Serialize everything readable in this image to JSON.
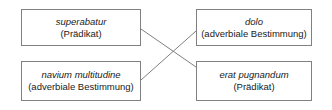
{
  "diagram": {
    "type": "crossed-correspondence-diagram",
    "background_color": "#ffffff",
    "border_color": "#808080",
    "connector_color": "#808080",
    "text_color": "#1a1a1a",
    "nodes": [
      {
        "id": "superabatur",
        "term": "superabatur",
        "role": "(Prädikat)"
      },
      {
        "id": "dolo",
        "term": "dolo",
        "role": "(adverbiale Bestimmung)"
      },
      {
        "id": "navium-multitudine",
        "term": "navium multitudine",
        "role": "(adverbiale Bestimmung)"
      },
      {
        "id": "erat-pugnandum",
        "term": "erat pugnandum",
        "role": "(Prädikat)"
      }
    ],
    "connectors": [
      {
        "id": "superabatur-to-erat-pugnandum",
        "from": "superabatur",
        "to": "erat-pugnandum"
      },
      {
        "id": "navium-multitudine-to-dolo",
        "from": "navium-multitudine",
        "to": "dolo"
      }
    ]
  }
}
